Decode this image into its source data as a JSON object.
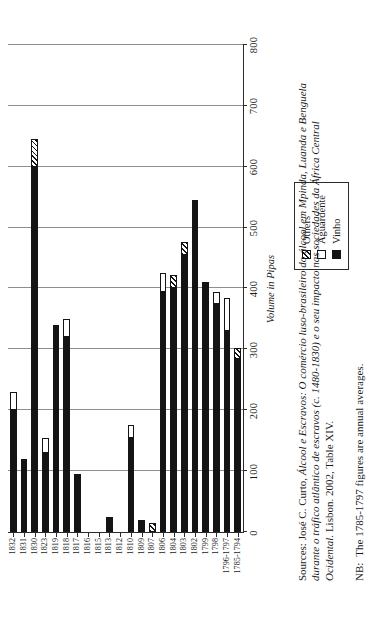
{
  "chart_data": {
    "type": "bar",
    "orientation": "horizontal",
    "title": "",
    "xlabel": "Volume in Pipas",
    "ylabel": "",
    "xlim": [
      0,
      800
    ],
    "xticks": [
      0,
      100,
      200,
      300,
      400,
      500,
      600,
      700,
      800
    ],
    "grid": true,
    "legend_position": "bottom-right",
    "stacked": true,
    "categories": [
      "1785-1794",
      "1796-1797",
      "1798",
      "1799",
      "1802",
      "1803",
      "1804",
      "1806",
      "1807",
      "1809",
      "1810",
      "1812",
      "1813",
      "1815",
      "1816",
      "1817",
      "1818",
      "1819",
      "1823",
      "1830",
      "1831",
      "1832"
    ],
    "series": [
      {
        "name": "Vinho",
        "color": "#141414",
        "values": [
          285,
          330,
          375,
          410,
          545,
          455,
          400,
          395,
          0,
          20,
          155,
          0,
          25,
          0,
          0,
          95,
          320,
          340,
          130,
          600,
          120,
          200
        ]
      },
      {
        "name": "Aguardente",
        "color": "#ffffff",
        "values": [
          0,
          55,
          20,
          0,
          0,
          0,
          0,
          30,
          0,
          0,
          20,
          0,
          0,
          0,
          0,
          0,
          30,
          0,
          25,
          0,
          0,
          30
        ]
      },
      {
        "name": "Others",
        "color": "hatched",
        "values": [
          18,
          0,
          0,
          0,
          0,
          22,
          22,
          0,
          15,
          0,
          0,
          0,
          0,
          0,
          0,
          0,
          0,
          0,
          0,
          45,
          0,
          0
        ]
      }
    ],
    "legend": [
      "Others",
      "Aguardente",
      "Vinho"
    ]
  },
  "legend": {
    "items": [
      {
        "label": "Others",
        "style": "hatched"
      },
      {
        "label": "Aguardente",
        "style": "white"
      },
      {
        "label": "Vinho",
        "style": "black"
      }
    ]
  },
  "axis": {
    "value_title": "Volume in Pipas",
    "value_ticks": [
      "0",
      "100",
      "200",
      "300",
      "400",
      "500",
      "600",
      "700",
      "800"
    ]
  },
  "source": {
    "label": "Sources:",
    "line1_plain": "José C. Curto,",
    "line1_italic": "Álcool e Escravos: O comércio luso-brasileiro do álcool em Mpinda, Luanda e Benguela",
    "line2_italic": "durante o tráfico atlântico de escravos (c. 1480-1830) e o seu impacto nas sociedades da África Central",
    "line3_italic": "Ocidental.",
    "line3_plain": "Lisbon. 2002, Table XIV."
  },
  "note": {
    "label": "NB:",
    "text": "The 1785-1797 figures are annual averages."
  }
}
